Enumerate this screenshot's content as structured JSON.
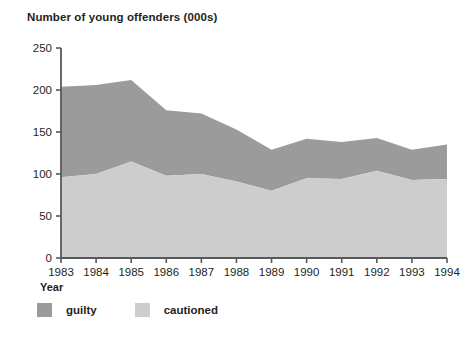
{
  "chart_data": {
    "type": "area",
    "title": "Number of young offenders (000s)",
    "xlabel": "Year",
    "ylabel": "",
    "stacked": true,
    "grid": false,
    "legend_position": "bottom-left",
    "categories": [
      "1983",
      "1984",
      "1985",
      "1986",
      "1987",
      "1988",
      "1989",
      "1990",
      "1991",
      "1992",
      "1993",
      "1994"
    ],
    "x": [
      1983,
      1984,
      1985,
      1986,
      1987,
      1988,
      1989,
      1990,
      1991,
      1992,
      1993,
      1994
    ],
    "xlim": [
      1983,
      1994
    ],
    "ylim": [
      0,
      250
    ],
    "yticks": [
      0,
      50,
      100,
      150,
      200,
      250
    ],
    "ytick_labels": [
      "0",
      "50",
      "100",
      "150",
      "200",
      "250"
    ],
    "xtick_labels": [
      "1983",
      "1984",
      "1985",
      "1986",
      "1987",
      "1988",
      "1989",
      "1990",
      "1991",
      "1992",
      "1993",
      "1994"
    ],
    "series": [
      {
        "name": "cautioned",
        "color": "#cdcdcd",
        "values": [
          96,
          100,
          115,
          98,
          100,
          91,
          80,
          95,
          94,
          104,
          93,
          94
        ]
      },
      {
        "name": "guilty",
        "color": "#9b9b9b",
        "values": [
          108,
          106,
          97,
          78,
          72,
          62,
          49,
          47,
          44,
          39,
          36,
          41
        ]
      }
    ],
    "totals": [
      204,
      206,
      212,
      176,
      172,
      153,
      129,
      142,
      138,
      143,
      129,
      135
    ]
  },
  "legend": {
    "items": [
      {
        "label": "guilty",
        "color": "#9b9b9b"
      },
      {
        "label": "cautioned",
        "color": "#cdcdcd"
      }
    ]
  },
  "colors": {
    "guilty": "#9b9b9b",
    "cautioned": "#cdcdcd",
    "axis": "#58595b",
    "text": "#231f20",
    "background": "#ffffff"
  }
}
